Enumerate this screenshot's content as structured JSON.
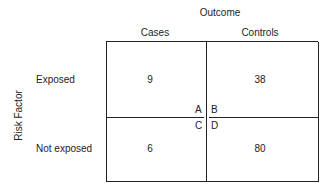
{
  "diagram": {
    "column_header": "Outcome",
    "row_header": "Risk Factor",
    "columns": [
      "Cases",
      "Controls"
    ],
    "rows": [
      {
        "label": "Exposed",
        "values": [
          "9",
          "38"
        ]
      },
      {
        "label": "Not exposed",
        "values": [
          "6",
          "80"
        ]
      }
    ],
    "cell_letters": [
      "A",
      "B",
      "C",
      "D"
    ]
  }
}
